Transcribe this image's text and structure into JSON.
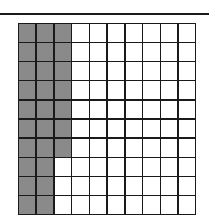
{
  "figure": {
    "type": "hundreds-grid",
    "rows": 10,
    "columns": 10,
    "total_cells": 100,
    "shaded_count": 27,
    "shaded_per_row": [
      3,
      3,
      3,
      3,
      3,
      3,
      3,
      2,
      2,
      2
    ],
    "colors": {
      "shaded": "#8a8a8a",
      "unshaded": "#ffffff",
      "grid_line": "#1a1a1a"
    }
  }
}
